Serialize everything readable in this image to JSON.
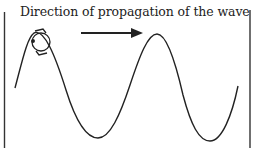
{
  "diagram": {
    "title_label": "Direction of propagation of the wave",
    "elements": [
      {
        "type": "boundary-line",
        "side": "left"
      },
      {
        "type": "boundary-line",
        "side": "right"
      },
      {
        "type": "arrow",
        "direction": "right",
        "meaning": "direction of propagation"
      },
      {
        "type": "sinusoidal-wave",
        "crests": 2,
        "troughs": 2
      },
      {
        "type": "circular-rotation-marker",
        "position": "first crest"
      }
    ],
    "colors": {
      "line": "#222222",
      "background": "#ffffff"
    }
  }
}
